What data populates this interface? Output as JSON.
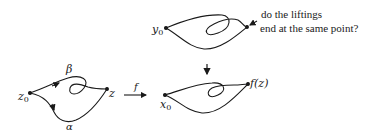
{
  "figure": {
    "top": {
      "base_point": "y",
      "base_point_sub": "0",
      "note_line1": "do the liftings",
      "note_line2": "end at the same point?"
    },
    "projection_arrow": "down-arrow",
    "left": {
      "base_point": "z",
      "base_point_sub": "0",
      "end_point": "z",
      "path_upper": "β",
      "path_lower": "α"
    },
    "map": {
      "label": "f"
    },
    "right": {
      "base_point": "x",
      "base_point_sub": "0",
      "end_point": "f(z)"
    },
    "colors": {
      "ink": "#1a1a1a",
      "background": "#ffffff"
    }
  }
}
